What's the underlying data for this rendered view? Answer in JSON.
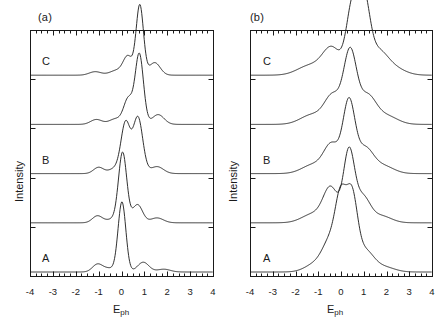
{
  "figure": {
    "panels": [
      {
        "id": "a",
        "label": "(a)",
        "xlabel_main": "E",
        "xlabel_sub": "ph",
        "ylabel": "Intensity",
        "curve_labels": [
          "A",
          "B",
          "C"
        ],
        "tick_labels": [
          "-4",
          "-3",
          "-2",
          "-1",
          "0",
          "1",
          "2",
          "3",
          "4"
        ]
      },
      {
        "id": "b",
        "label": "(b)",
        "xlabel_main": "E",
        "xlabel_sub": "ph",
        "ylabel": "Intensity",
        "curve_labels": [
          "A",
          "B",
          "C"
        ],
        "tick_labels": [
          "-4",
          "-3",
          "-2",
          "-1",
          "0",
          "1",
          "2",
          "3",
          "4"
        ]
      }
    ]
  },
  "chart_data": [
    {
      "type": "line",
      "panel": "a",
      "title": "(a)",
      "xlabel": "E_ph",
      "ylabel": "Intensity",
      "xlim": [
        -4,
        4
      ],
      "xticks": [
        -4,
        -3,
        -2,
        -1,
        0,
        1,
        2,
        3,
        4
      ],
      "minor_tick_interval": 0.25,
      "yticks_shown": false,
      "grid": false,
      "legend": "none",
      "stacked_offset_spectra": true,
      "series": [
        {
          "name": "A",
          "label": "A",
          "offset_index": 0,
          "peaks": [
            {
              "center": -1.05,
              "height": 0.11,
              "width": 0.22
            },
            {
              "center": -0.55,
              "height": 0.05,
              "width": 0.25
            },
            {
              "center": 0.02,
              "height": 1.0,
              "width": 0.17
            },
            {
              "center": 0.95,
              "height": 0.14,
              "width": 0.25
            },
            {
              "center": 1.85,
              "height": 0.04,
              "width": 0.28
            }
          ]
        },
        {
          "name": "spectrum-2",
          "label": "",
          "offset_index": 1,
          "peaks": [
            {
              "center": -1.05,
              "height": 0.1,
              "width": 0.22
            },
            {
              "center": -0.4,
              "height": 0.05,
              "width": 0.25
            },
            {
              "center": 0.05,
              "height": 1.0,
              "width": 0.18
            },
            {
              "center": 0.7,
              "height": 0.26,
              "width": 0.22
            },
            {
              "center": 1.55,
              "height": 0.07,
              "width": 0.28
            }
          ]
        },
        {
          "name": "B",
          "label": "B",
          "offset_index": 2,
          "peaks": [
            {
              "center": -1.0,
              "height": 0.09,
              "width": 0.22
            },
            {
              "center": -0.3,
              "height": 0.07,
              "width": 0.25
            },
            {
              "center": 0.18,
              "height": 0.72,
              "width": 0.2
            },
            {
              "center": 0.72,
              "height": 0.8,
              "width": 0.21
            },
            {
              "center": 1.55,
              "height": 0.1,
              "width": 0.28
            }
          ]
        },
        {
          "name": "spectrum-4",
          "label": "",
          "offset_index": 3,
          "peaks": [
            {
              "center": -1.1,
              "height": 0.07,
              "width": 0.25
            },
            {
              "center": -0.25,
              "height": 0.08,
              "width": 0.28
            },
            {
              "center": 0.3,
              "height": 0.36,
              "width": 0.2
            },
            {
              "center": 0.78,
              "height": 1.0,
              "width": 0.18
            },
            {
              "center": 1.6,
              "height": 0.14,
              "width": 0.26
            }
          ]
        },
        {
          "name": "C",
          "label": "C",
          "offset_index": 4,
          "peaks": [
            {
              "center": -1.15,
              "height": 0.05,
              "width": 0.26
            },
            {
              "center": -0.2,
              "height": 0.07,
              "width": 0.3
            },
            {
              "center": 0.28,
              "height": 0.26,
              "width": 0.2
            },
            {
              "center": 0.8,
              "height": 1.0,
              "width": 0.16
            },
            {
              "center": 1.45,
              "height": 0.18,
              "width": 0.24
            }
          ]
        }
      ]
    },
    {
      "type": "line",
      "panel": "b",
      "title": "(b)",
      "xlabel": "E_ph",
      "ylabel": "Intensity",
      "xlim": [
        -4,
        4
      ],
      "xticks": [
        -4,
        -3,
        -2,
        -1,
        0,
        1,
        2,
        3,
        4
      ],
      "minor_tick_interval": 0.25,
      "yticks_shown": false,
      "grid": false,
      "legend": "none",
      "stacked_offset_spectra": true,
      "series": [
        {
          "name": "A",
          "label": "A",
          "offset_index": 0,
          "peaks": [
            {
              "center": -1.1,
              "height": 0.12,
              "width": 0.45
            },
            {
              "center": -0.45,
              "height": 0.42,
              "width": 0.34
            },
            {
              "center": 0.0,
              "height": 0.92,
              "width": 0.24
            },
            {
              "center": 0.48,
              "height": 1.0,
              "width": 0.24
            },
            {
              "center": 1.05,
              "height": 0.3,
              "width": 0.38
            },
            {
              "center": 1.9,
              "height": 0.07,
              "width": 0.45
            }
          ]
        },
        {
          "name": "spectrum-2",
          "label": "",
          "offset_index": 1,
          "peaks": [
            {
              "center": -1.2,
              "height": 0.13,
              "width": 0.5
            },
            {
              "center": -0.45,
              "height": 0.48,
              "width": 0.32
            },
            {
              "center": 0.35,
              "height": 1.0,
              "width": 0.24
            },
            {
              "center": 0.95,
              "height": 0.36,
              "width": 0.32
            },
            {
              "center": 1.75,
              "height": 0.1,
              "width": 0.45
            }
          ]
        },
        {
          "name": "B",
          "label": "B",
          "offset_index": 2,
          "peaks": [
            {
              "center": -1.2,
              "height": 0.13,
              "width": 0.5
            },
            {
              "center": -0.4,
              "height": 0.4,
              "width": 0.34
            },
            {
              "center": 0.35,
              "height": 1.0,
              "width": 0.26
            },
            {
              "center": 1.05,
              "height": 0.35,
              "width": 0.36
            },
            {
              "center": 1.85,
              "height": 0.11,
              "width": 0.46
            }
          ]
        },
        {
          "name": "spectrum-4",
          "label": "",
          "offset_index": 3,
          "peaks": [
            {
              "center": -1.25,
              "height": 0.14,
              "width": 0.52
            },
            {
              "center": -0.35,
              "height": 0.4,
              "width": 0.36
            },
            {
              "center": 0.4,
              "height": 1.0,
              "width": 0.28
            },
            {
              "center": 1.15,
              "height": 0.4,
              "width": 0.38
            },
            {
              "center": 2.0,
              "height": 0.12,
              "width": 0.48
            }
          ]
        },
        {
          "name": "C",
          "label": "C",
          "offset_index": 4,
          "peaks": [
            {
              "center": -1.35,
              "height": 0.14,
              "width": 0.55
            },
            {
              "center": -0.4,
              "height": 0.38,
              "width": 0.4
            },
            {
              "center": 0.5,
              "height": 0.95,
              "width": 0.26
            },
            {
              "center": 1.0,
              "height": 1.0,
              "width": 0.26
            },
            {
              "center": 1.6,
              "height": 0.32,
              "width": 0.42
            },
            {
              "center": 2.3,
              "height": 0.1,
              "width": 0.5
            }
          ]
        }
      ]
    }
  ],
  "style": {
    "line_color": "#1a1a1a",
    "axis_color": "#1a1a1a",
    "background": "#ffffff"
  }
}
